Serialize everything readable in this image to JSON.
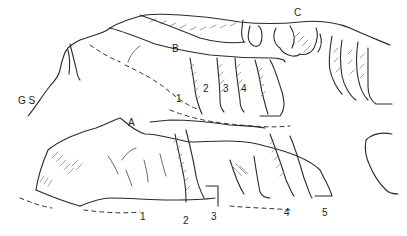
{
  "figure": {
    "type": "rock-outcrop-sketch",
    "labels": {
      "site": "G S",
      "rock_a": "A",
      "rock_b": "B",
      "rock_c": "C"
    },
    "rock_a_panels": [
      "1",
      "2",
      "3",
      "4",
      "5"
    ],
    "rock_b_panels": [
      "1",
      "2",
      "3",
      "4"
    ]
  }
}
